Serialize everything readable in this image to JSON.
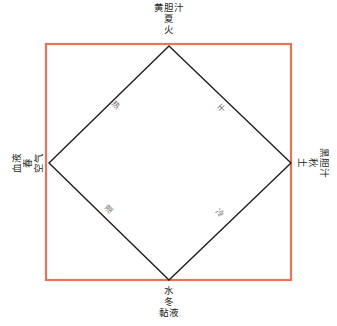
{
  "diagram": {
    "frame_color": "#e8735a",
    "line_color": "#231f20",
    "vertices": {
      "top": {
        "humor": "黄胆汁",
        "season": "夏",
        "element": "火"
      },
      "right": {
        "humor": "黑胆汁",
        "season": "秋",
        "element": "土"
      },
      "bottom": {
        "element": "水",
        "season": "冬",
        "humor": "黏液"
      },
      "left": {
        "humor": "血液",
        "season": "春",
        "element": "空气"
      }
    },
    "edges": {
      "top_left": "热",
      "top_right": "干",
      "bottom_right": "冷",
      "bottom_left": "湿"
    }
  }
}
